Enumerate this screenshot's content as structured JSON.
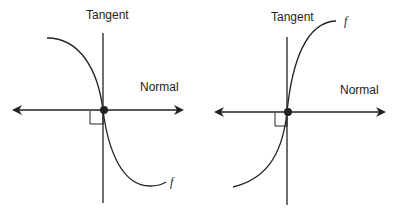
{
  "diagrams": [
    {
      "id": "left",
      "tangent_label": "Tangent",
      "normal_label": "Normal",
      "function_label": "f",
      "description": "Decreasing curve; vertical tangent at point of tangency, horizontal normal with arrows"
    },
    {
      "id": "right",
      "tangent_label": "Tangent",
      "normal_label": "Normal",
      "function_label": "f",
      "description": "Increasing curve; vertical tangent at point of tangency, horizontal normal with arrows"
    }
  ],
  "colors": {
    "stroke": "#222222",
    "background": "#ffffff"
  }
}
